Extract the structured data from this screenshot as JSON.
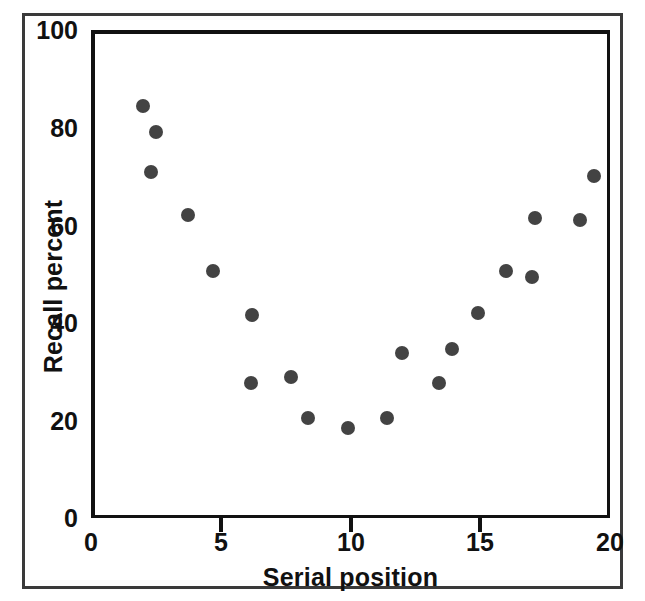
{
  "chart_data": {
    "type": "scatter",
    "title": "",
    "xlabel": "Serial position",
    "ylabel": "Recall percent",
    "xlim": [
      0,
      20
    ],
    "ylim": [
      0,
      100
    ],
    "xticks": [
      0,
      5,
      10,
      15,
      20
    ],
    "xtick_labels": [
      "0",
      "5",
      "10",
      "15",
      "20"
    ],
    "yticks": [
      0,
      20,
      40,
      60,
      80,
      100
    ],
    "ytick_labels": [
      "0",
      "20",
      "40",
      "60",
      "80",
      "100"
    ],
    "grid": false,
    "legend": null,
    "marker": "filled-circle",
    "marker_color": "#434343",
    "points": [
      {
        "x": 2.0,
        "y": 84.4
      },
      {
        "x": 2.5,
        "y": 79.0
      },
      {
        "x": 2.3,
        "y": 71.0
      },
      {
        "x": 3.75,
        "y": 62.0
      },
      {
        "x": 4.7,
        "y": 50.6
      },
      {
        "x": 6.2,
        "y": 41.5
      },
      {
        "x": 6.15,
        "y": 27.7
      },
      {
        "x": 7.7,
        "y": 28.8
      },
      {
        "x": 8.35,
        "y": 20.4
      },
      {
        "x": 9.9,
        "y": 18.5
      },
      {
        "x": 11.4,
        "y": 20.4
      },
      {
        "x": 12.0,
        "y": 33.8
      },
      {
        "x": 13.4,
        "y": 27.7
      },
      {
        "x": 13.9,
        "y": 34.6
      },
      {
        "x": 14.9,
        "y": 42.0
      },
      {
        "x": 16.0,
        "y": 50.6
      },
      {
        "x": 17.0,
        "y": 49.4
      },
      {
        "x": 17.1,
        "y": 61.5
      },
      {
        "x": 18.85,
        "y": 61.0
      },
      {
        "x": 19.4,
        "y": 70.0
      }
    ]
  },
  "colors": {
    "axis": "#111111",
    "marker": "#434343",
    "outer_border": "#3a3a3a",
    "background": "#ffffff"
  }
}
